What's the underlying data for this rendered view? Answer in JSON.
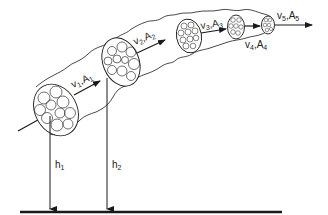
{
  "diagram": {
    "title": "",
    "type": "stream tube with varying cross-section",
    "colors": {
      "stroke": "#1a1a1a",
      "background": "#ffffff"
    },
    "sections": [
      {
        "id": 1,
        "velocity_label": "v",
        "velocity_sub": "1",
        "area_label": "A",
        "area_sub": "1"
      },
      {
        "id": 2,
        "velocity_label": "v",
        "velocity_sub": "2",
        "area_label": "A",
        "area_sub": "2"
      },
      {
        "id": 3,
        "velocity_label": "v",
        "velocity_sub": "3",
        "area_label": "A",
        "area_sub": "3"
      },
      {
        "id": 4,
        "velocity_label": "v",
        "velocity_sub": "4",
        "area_label": "A",
        "area_sub": "4"
      },
      {
        "id": 5,
        "velocity_label": "v",
        "velocity_sub": "5",
        "area_label": "A",
        "area_sub": "5"
      }
    ],
    "heights": [
      {
        "label": "h",
        "sub": "1"
      },
      {
        "label": "h",
        "sub": "2"
      }
    ],
    "separator": ","
  }
}
